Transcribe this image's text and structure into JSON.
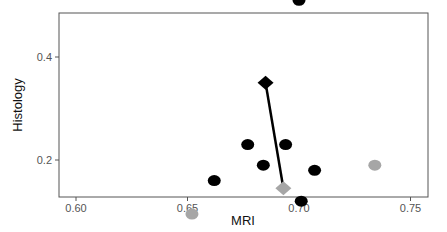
{
  "chart_data": {
    "type": "scatter",
    "title": "",
    "xlabel": "MRI",
    "ylabel": "Histology",
    "xlim": [
      0.592,
      0.758
    ],
    "ylim": [
      0.07,
      0.78
    ],
    "xticks": [
      0.6,
      0.65,
      0.7,
      0.75
    ],
    "xtick_labels": [
      "0.60",
      "0.65",
      "0.70",
      "0.75"
    ],
    "yticks": [
      0.2,
      0.4,
      0.6
    ],
    "ytick_labels": [
      "0.2",
      "0.4",
      "0.6"
    ],
    "grid": false,
    "legend": null,
    "series": [
      {
        "name": "black-points",
        "marker": "circle",
        "color": "#000000",
        "points": [
          {
            "x": 0.632,
            "y": 0.735
          },
          {
            "x": 0.662,
            "y": 0.55
          },
          {
            "x": 0.7,
            "y": 0.51
          },
          {
            "x": 0.732,
            "y": 0.57
          },
          {
            "x": 0.662,
            "y": 0.16
          },
          {
            "x": 0.677,
            "y": 0.23
          },
          {
            "x": 0.684,
            "y": 0.19
          },
          {
            "x": 0.694,
            "y": 0.23
          },
          {
            "x": 0.701,
            "y": 0.12
          },
          {
            "x": 0.707,
            "y": 0.18
          }
        ]
      },
      {
        "name": "gray-points",
        "marker": "circle",
        "color": "#a6a6a6",
        "points": [
          {
            "x": 0.652,
            "y": 0.095
          },
          {
            "x": 0.734,
            "y": 0.19
          }
        ]
      },
      {
        "name": "black-diamond",
        "marker": "diamond",
        "color": "#000000",
        "points": [
          {
            "x": 0.685,
            "y": 0.35
          }
        ]
      },
      {
        "name": "gray-diamond",
        "marker": "diamond",
        "color": "#a6a6a6",
        "points": [
          {
            "x": 0.693,
            "y": 0.145
          }
        ]
      }
    ],
    "annotations": [
      {
        "type": "segment",
        "from": {
          "x": 0.685,
          "y": 0.35
        },
        "to": {
          "x": 0.693,
          "y": 0.145
        },
        "color": "#000000"
      }
    ]
  }
}
